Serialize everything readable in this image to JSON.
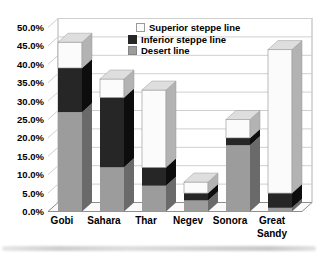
{
  "chart_data": {
    "type": "bar",
    "variant": "stacked-3d-column",
    "title": "",
    "xlabel": "",
    "ylabel": "",
    "categories": [
      "Gobi",
      "Sahara",
      "Thar",
      "Negev",
      "Sonora",
      "Great Sandy"
    ],
    "series": [
      {
        "name": "Desert line",
        "color": "#9c9c9c",
        "side_color": "#6a6a6a",
        "top_color": "#b8b8b8",
        "values": [
          27,
          12,
          7,
          3,
          18,
          1
        ]
      },
      {
        "name": "Inferior steppe line",
        "color": "#262626",
        "side_color": "#0d0d0d",
        "top_color": "#3a3a3a",
        "values": [
          12,
          19,
          5,
          2,
          2,
          4
        ]
      },
      {
        "name": "Superior steppe line",
        "color": "#fbfbfb",
        "side_color": "#b3b3b3",
        "top_color": "#dedede",
        "values": [
          7,
          5,
          21,
          3,
          5,
          39
        ]
      }
    ],
    "stack_order_bottom_to_top": [
      "Desert line",
      "Inferior steppe line",
      "Superior steppe line"
    ],
    "totals_percent": [
      46,
      36,
      33,
      8,
      25,
      44
    ],
    "y_ticks": [
      "0.0%",
      "5.0%",
      "10.0%",
      "15.0%",
      "20.0%",
      "25.0%",
      "30.0%",
      "35.0%",
      "40.0%",
      "45.0%",
      "50.0%"
    ],
    "ylim": [
      0,
      50
    ],
    "grid": true,
    "legend_position": "top-center"
  },
  "legend": {
    "items": [
      {
        "label": "Superior steppe line",
        "color": "#fbfbfb",
        "border": "#9a9a9a"
      },
      {
        "label": "Inferior steppe line",
        "color": "#262626",
        "border": "#262626"
      },
      {
        "label": "Desert line",
        "color": "#9c9c9c",
        "border": "#858585"
      }
    ]
  },
  "colors": {
    "background": "#ffffff",
    "gridline": "#cfcfcf",
    "wall_edge": "#b2b2b2",
    "floor_edge": "#8f8f8f",
    "text": "#000000"
  }
}
